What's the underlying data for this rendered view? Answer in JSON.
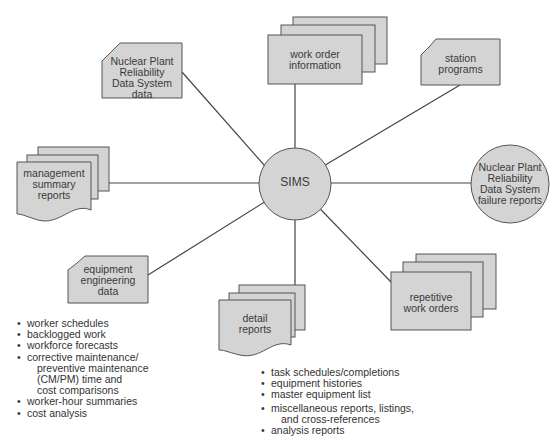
{
  "diagram": {
    "hub": {
      "label": "SIMS"
    },
    "nodes": [
      {
        "id": "nprds-data",
        "shape": "card",
        "lines": [
          "Nuclear Plant",
          "Reliability",
          "Data System",
          "data"
        ]
      },
      {
        "id": "work-order-information",
        "shape": "document-stack",
        "lines": [
          "work order",
          "information"
        ]
      },
      {
        "id": "station-programs",
        "shape": "card",
        "lines": [
          "station",
          "programs"
        ]
      },
      {
        "id": "management-summary-reports",
        "shape": "wavy-document-stack",
        "lines": [
          "management",
          "summary",
          "reports"
        ]
      },
      {
        "id": "nprds-failure-reports",
        "shape": "circle",
        "lines": [
          "Nuclear Plant",
          "Reliability",
          "Data System",
          "failure reports"
        ]
      },
      {
        "id": "equipment-engineering-data",
        "shape": "card",
        "lines": [
          "equipment",
          "engineering",
          "data"
        ]
      },
      {
        "id": "detail-reports",
        "shape": "wavy-document-stack",
        "lines": [
          "detail",
          "reports"
        ]
      },
      {
        "id": "repetitive-work-orders",
        "shape": "document-stack",
        "lines": [
          "repetitive",
          "work orders"
        ]
      }
    ],
    "management_report_contents": [
      {
        "text": "worker schedules"
      },
      {
        "text": "backlogged work"
      },
      {
        "text": "workforce forecasts"
      },
      {
        "text": "corrective maintenance/",
        "cont": [
          "preventive maintenance",
          "(CM/PM) time and",
          "cost comparisons"
        ]
      },
      {
        "text": "worker-hour summaries"
      },
      {
        "text": "cost analysis"
      }
    ],
    "detail_report_contents": [
      {
        "text": "task schedules/completions"
      },
      {
        "text": "equipment histories"
      },
      {
        "text": "master equipment list"
      },
      {
        "text": "miscellaneous reports, listings,",
        "cont": [
          "and cross-references"
        ]
      },
      {
        "text": "analysis reports"
      }
    ],
    "colors": {
      "fill": "#d4d4d4",
      "stroke": "#555555",
      "line": "#444444"
    }
  }
}
